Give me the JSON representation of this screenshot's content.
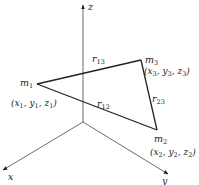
{
  "diagram": {
    "colors": {
      "axis": "#333333",
      "triangle": "#222222",
      "text": "#222222"
    },
    "axes": [
      {
        "id": "z",
        "label": "z",
        "from": [
          83,
          122
        ],
        "to": [
          83,
          5
        ]
      },
      {
        "id": "x",
        "label": "x",
        "from": [
          83,
          122
        ],
        "to": [
          3,
          170
        ]
      },
      {
        "id": "y",
        "label": "y",
        "from": [
          83,
          122
        ],
        "to": [
          168,
          174
        ]
      }
    ],
    "masses": [
      {
        "id": "m1",
        "name": "m",
        "sub": "1",
        "point": [
          37,
          84
        ],
        "coords": [
          "x",
          "1",
          "y",
          "1",
          "z",
          "1"
        ]
      },
      {
        "id": "m2",
        "name": "m",
        "sub": "2",
        "point": [
          157,
          130
        ],
        "coords": [
          "x",
          "2",
          "y",
          "2",
          "z",
          "2"
        ]
      },
      {
        "id": "m3",
        "name": "m",
        "sub": "3",
        "point": [
          141,
          60
        ],
        "coords": [
          "x",
          "3",
          "y",
          "3",
          "z",
          "3"
        ]
      }
    ],
    "edges": [
      {
        "id": "r12",
        "name": "r",
        "sub": "12",
        "from": "m1",
        "to": "m2"
      },
      {
        "id": "r13",
        "name": "r",
        "sub": "13",
        "from": "m1",
        "to": "m3"
      },
      {
        "id": "r23",
        "name": "r",
        "sub": "23",
        "from": "m3",
        "to": "m2"
      }
    ]
  },
  "labels": {
    "axis_z": "z",
    "axis_x": "x",
    "axis_y": "y",
    "m1_name": "m",
    "m1_sub": "1",
    "m2_name": "m",
    "m2_sub": "2",
    "m3_name": "m",
    "m3_sub": "3",
    "r12_name": "r",
    "r12_sub": "12",
    "r13_name": "r",
    "r13_sub": "13",
    "r23_name": "r",
    "r23_sub": "23",
    "m1_coords": {
      "open": "(",
      "x": "x",
      "xs": "1",
      "y": "y",
      "ys": "1",
      "z": "z",
      "zs": "1",
      "close": ")",
      "sep": ", "
    },
    "m2_coords": {
      "open": "(",
      "x": "x",
      "xs": "2",
      "y": "y",
      "ys": "2",
      "z": "z",
      "zs": "2",
      "close": ")",
      "sep": ", "
    },
    "m3_coords": {
      "open": "(",
      "x": "x",
      "xs": "3",
      "y": "y",
      "ys": "3",
      "z": "z",
      "zs": "3",
      "close": ")",
      "sep": ", "
    }
  }
}
